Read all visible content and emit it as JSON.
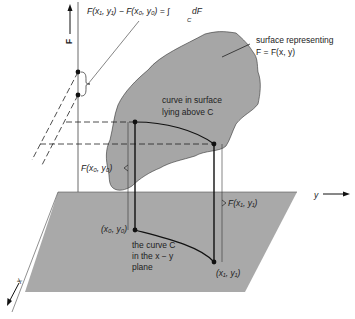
{
  "labels": {
    "formula_lhs": "F(x₁, y₁) − F(x₀, y₀) = ∫",
    "formula_sub": "C",
    "formula_rhs": "dF",
    "surface_line1": "surface representing",
    "surface_line2": "F = F(x, y)",
    "curve_surface_line1": "curve in surface",
    "curve_surface_line2": "lying above C",
    "F_axis": "F",
    "y_axis": "y",
    "x_axis": "x",
    "F0": "F(x₀, y₀)",
    "F1": "F(x₁, y₁)",
    "p0": "(x₀, y₀)",
    "p1": "(x₁, y₁)",
    "curve_plane_line1": "the curve C",
    "curve_plane_line2": "in the x − y",
    "curve_plane_line3": "plane"
  },
  "colors": {
    "surface_fill": "#a6a6a6",
    "plane_fill": "#a9a9a9",
    "line": "#111111"
  }
}
